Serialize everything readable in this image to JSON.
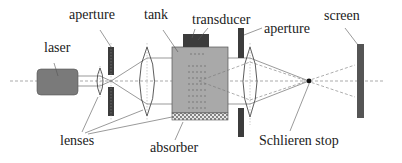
{
  "diagram": {
    "type": "schlieren-optical-setup",
    "labels": {
      "laser": "laser",
      "aperture_left": "aperture",
      "tank": "tank",
      "transducer": "transducer",
      "aperture_right": "aperture",
      "screen": "screen",
      "lenses": "lenses",
      "absorber": "absorber",
      "schlieren_stop": "Schlieren stop"
    },
    "colors": {
      "background": "#ffffff",
      "laser_fill": "#7a7a7a",
      "tank_fill": "#a9a9a9",
      "dark_element": "#3c3c3c",
      "screen_fill": "#555555",
      "line": "#444444",
      "dashed": "#777777"
    }
  }
}
